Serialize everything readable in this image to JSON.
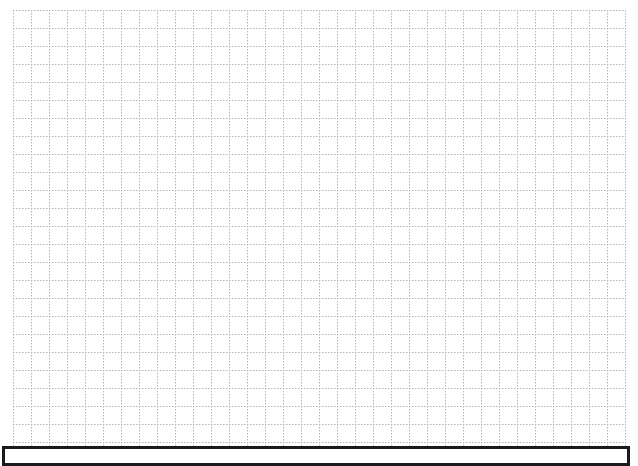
{
  "page": {
    "title": "",
    "type": "graph-paper worksheet"
  },
  "grid": {
    "columns": 34,
    "rows": 24,
    "line_style": "dotted",
    "line_color": "#b4b4b4"
  },
  "answer_box": {
    "text": "",
    "border_color": "#1a1a1a"
  }
}
